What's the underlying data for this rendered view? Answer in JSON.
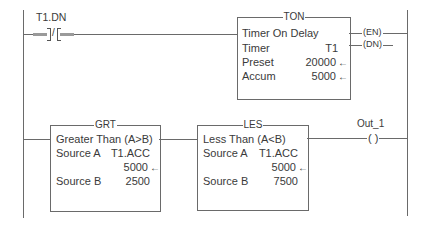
{
  "rung0": {
    "contact": {
      "tag": "T1.DN",
      "type": "XIO",
      "glyph": "]/["
    },
    "ton": {
      "mnemonic": "TON",
      "title": "Timer On Delay",
      "rows": [
        {
          "label": "Timer",
          "value": "T1"
        },
        {
          "label": "Preset",
          "value": "20000",
          "arrow": "←"
        },
        {
          "label": "Accum",
          "value": "5000",
          "arrow": "←"
        }
      ],
      "outputs": [
        {
          "label": "EN"
        },
        {
          "label": "DN"
        }
      ]
    }
  },
  "rung1": {
    "grt": {
      "mnemonic": "GRT",
      "title": "Greater Than (A>B)",
      "source_a_label": "Source A",
      "source_a_tag": "T1.ACC",
      "source_a_value": "5000",
      "source_b_label": "Source B",
      "source_b_value": "2500",
      "arrow": "←"
    },
    "les": {
      "mnemonic": "LES",
      "title": "Less Than (A<B)",
      "source_a_label": "Source A",
      "source_a_tag": "T1.ACC",
      "source_a_value": "5000",
      "source_b_label": "Source B",
      "source_b_value": "7500",
      "arrow": "←"
    },
    "coil": {
      "tag": "Out_1",
      "glyph": "( )"
    }
  }
}
